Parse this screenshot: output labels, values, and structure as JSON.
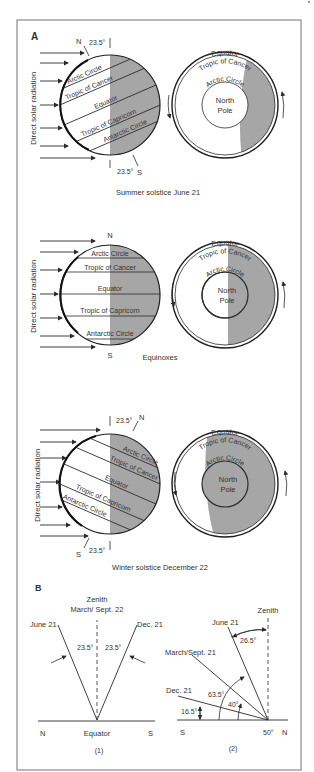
{
  "panelA": {
    "label": "A",
    "radiation_label": "Direct solar radiation",
    "summer": {
      "caption": "Summer solstice June 21",
      "north": "N",
      "south": "S",
      "tilt_top": "23.5°",
      "tilt_bottom": "23.5°",
      "lines": [
        "Arctic Circle",
        "Tropic of Cancer",
        "Equator",
        "Tropic of Capricorn",
        "Antarctic Circle"
      ],
      "polar": {
        "equator": "Equator",
        "tropic": "Tropic of Cancer",
        "arctic": "Arctic Circle",
        "pole_line1": "North",
        "pole_line2": "Pole"
      }
    },
    "equinox": {
      "caption": "Equinoxes",
      "north": "N",
      "south": "S",
      "lines": [
        "Arctic Circle",
        "Tropic of Cancer",
        "Equator",
        "Tropic of Capricorn",
        "Antarctic Circle"
      ],
      "polar": {
        "equator": "Equator",
        "tropic": "Tropic of Cancer",
        "arctic": "Arctic Circle",
        "pole_line1": "North",
        "pole_line2": "Pole"
      }
    },
    "winter": {
      "caption": "Winter solstice December 22",
      "north": "N",
      "south": "S",
      "tilt_top": "23.5°",
      "tilt_bottom": "23.5°",
      "lines": [
        "Arctic Circle",
        "Tropic of Cancer",
        "Equator",
        "Tropic of Capricorn",
        "Antarctic Circle"
      ],
      "polar": {
        "equator": "Equator",
        "tropic": "Tropic of Cancer",
        "arctic": "Arctic Circle",
        "pole_line1": "North",
        "pole_line2": "Pole"
      }
    }
  },
  "panelB": {
    "label": "B",
    "fig1": {
      "zenith": "Zenith",
      "zenith_date": "March/ Sept. 22",
      "june": "June 21",
      "dec": "Dec. 21",
      "angle_left": "23.5°",
      "angle_right": "23.5°",
      "north": "N",
      "center": "Equator",
      "south": "S",
      "number": "(1)"
    },
    "fig2": {
      "zenith": "Zenith",
      "june": "June 21",
      "march": "March/Sept. 21",
      "dec": "Dec. 21",
      "angle_june": "26.5°",
      "angle_march": "63.5°",
      "angle_40": "40°",
      "angle_dec": "16.5°",
      "south": "S",
      "latitude": "50°",
      "north": "N",
      "number": "(2)"
    }
  },
  "colors": {
    "shade": "#a6a6a6",
    "line": "#2b2b2b",
    "frame": "#8a8a8a",
    "text": "#333333"
  }
}
